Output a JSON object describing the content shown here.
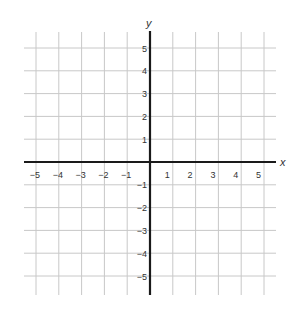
{
  "chart_data": {
    "type": "scatter",
    "title": "",
    "xlabel": "x",
    "ylabel": "y",
    "xlim": [
      -5.5,
      5.5
    ],
    "ylim": [
      -5.7,
      5.5
    ],
    "grid": true,
    "x_ticks": [
      -5,
      -4,
      -3,
      -2,
      -1,
      1,
      2,
      3,
      4,
      5
    ],
    "y_ticks": [
      5,
      4,
      3,
      2,
      1,
      -1,
      -2,
      -3,
      -4,
      -5
    ],
    "x_tick_labels": [
      "−5",
      "−4",
      "−3",
      "−2",
      "−1",
      "1",
      "2",
      "3",
      "4",
      "5"
    ],
    "y_tick_labels": [
      "5",
      "4",
      "3",
      "2",
      "1",
      "−1",
      "−2",
      "−3",
      "−4",
      "−5"
    ],
    "points": []
  },
  "colors": {
    "grid": "#c8c8c8",
    "axis": "#1a1a1a",
    "text": "#333333"
  }
}
